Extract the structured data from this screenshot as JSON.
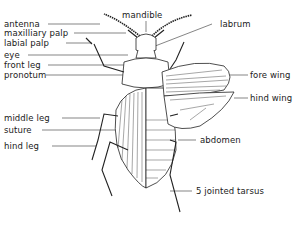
{
  "diagram": {
    "labels_left": [
      {
        "id": "antenna",
        "text": "antenna"
      },
      {
        "id": "maxilliary-palp",
        "text": "maxilliary palp"
      },
      {
        "id": "labial-palp",
        "text": "labial palp"
      },
      {
        "id": "eye",
        "text": "eye"
      },
      {
        "id": "front-leg",
        "text": "front leg"
      },
      {
        "id": "pronotum",
        "text": "pronotum"
      },
      {
        "id": "middle-leg",
        "text": "middle leg"
      },
      {
        "id": "suture",
        "text": "suture"
      },
      {
        "id": "hind-leg",
        "text": "hind leg"
      }
    ],
    "labels_top": [
      {
        "id": "mandible",
        "text": "mandible"
      }
    ],
    "labels_right": [
      {
        "id": "labrum",
        "text": "labrum"
      },
      {
        "id": "fore-wing",
        "text": "fore wing"
      },
      {
        "id": "hind-wing",
        "text": "hind wing"
      },
      {
        "id": "abdomen",
        "text": "abdomen"
      },
      {
        "id": "tarsus",
        "text": "5 jointed tarsus"
      }
    ]
  }
}
